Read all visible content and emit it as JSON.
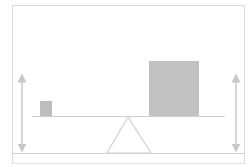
{
  "diagram": {
    "title": "",
    "colors": {
      "stroke": "#d2d2d2",
      "frame": "#d9d9d9",
      "block_fill": "#bdbdbd",
      "arrow": "#c8c8c8",
      "background": "#ffffff"
    },
    "elements": {
      "left_block": {
        "label": "",
        "relative_size": "small"
      },
      "right_block": {
        "label": "",
        "relative_size": "large"
      },
      "fulcrum": {
        "shape": "triangle",
        "label": ""
      },
      "beam": {
        "label": ""
      },
      "left_arrow": {
        "direction": "up-down",
        "label": ""
      },
      "right_arrow": {
        "direction": "up-down",
        "label": ""
      }
    }
  }
}
